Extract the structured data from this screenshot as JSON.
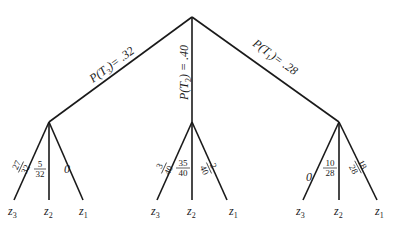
{
  "diagram": {
    "type": "probability-tree",
    "root_branches": [
      {
        "id": "T3",
        "label": "P(T",
        "sub": "3",
        "tail": ")= .32"
      },
      {
        "id": "T2",
        "label": "P(T",
        "sub": "2",
        "tail": ") = .40"
      },
      {
        "id": "T1",
        "label": "P(T",
        "sub": "1",
        "tail": ")= .28"
      }
    ],
    "subtrees": [
      {
        "parent": "T3",
        "leaves": [
          {
            "name": "z",
            "sub": "3",
            "prob_num": "27",
            "prob_den": "32"
          },
          {
            "name": "z",
            "sub": "2",
            "prob_num": "5",
            "prob_den": "32"
          },
          {
            "name": "z",
            "sub": "1",
            "prob": "0"
          }
        ]
      },
      {
        "parent": "T2",
        "leaves": [
          {
            "name": "z",
            "sub": "3",
            "prob_num": "3",
            "prob_den": "40"
          },
          {
            "name": "z",
            "sub": "2",
            "prob_num": "35",
            "prob_den": "40"
          },
          {
            "name": "z",
            "sub": "1",
            "prob_num": "2",
            "prob_den": "40"
          }
        ]
      },
      {
        "parent": "T1",
        "leaves": [
          {
            "name": "z",
            "sub": "3",
            "prob": "0"
          },
          {
            "name": "z",
            "sub": "2",
            "prob_num": "10",
            "prob_den": "28"
          },
          {
            "name": "z",
            "sub": "1",
            "prob_num": "18",
            "prob_den": "28"
          }
        ]
      }
    ]
  }
}
